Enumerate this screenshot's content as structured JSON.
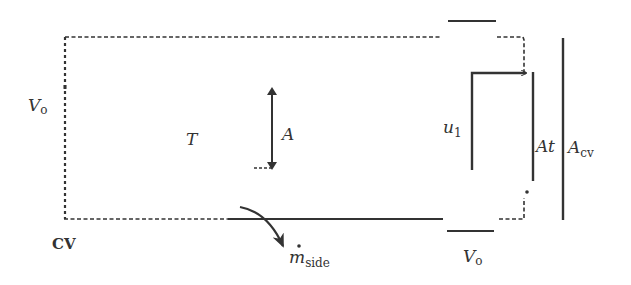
{
  "diagram": {
    "type": "control-volume schematic",
    "colors": {
      "ink": "#333333",
      "background": "#ffffff"
    },
    "labels": {
      "cv": "CV",
      "volume_left": {
        "main": "V",
        "sub": "o"
      },
      "volume_bottom": {
        "main": "V",
        "sub": "o"
      },
      "temperature": "T",
      "area": "A",
      "jet_velocity": {
        "main": "u",
        "sub": "1"
      },
      "throat_area": "At",
      "cv_area": {
        "main": "A",
        "sub": "cv"
      },
      "side_mass_flow": {
        "main": "m",
        "sub": "side",
        "accent": "dot"
      }
    },
    "elements": [
      "dashed control-volume boundary",
      "top wall segment",
      "bottom wall segment",
      "double-headed arrow (A)",
      "L-shaped jet path (u1)",
      "throat line (At)",
      "control-volume face line (Acv)",
      "curved side outflow arrow"
    ]
  }
}
